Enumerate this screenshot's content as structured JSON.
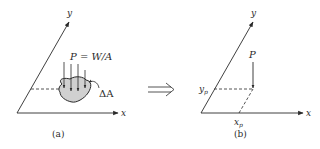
{
  "panel_a": {
    "caption": "(a)",
    "axis_x": "x",
    "axis_y": "y",
    "load_label": "P = W/A",
    "area_label": "ΔA"
  },
  "panel_b": {
    "caption": "(b)",
    "axis_x": "x",
    "axis_y": "y",
    "force_label": "P",
    "xp_label": "x",
    "xp_sub": "p",
    "yp_label": "y",
    "yp_sub": "p"
  },
  "colors": {
    "line": "#2a2a2a",
    "shaded_area": "#d0d0d0"
  }
}
